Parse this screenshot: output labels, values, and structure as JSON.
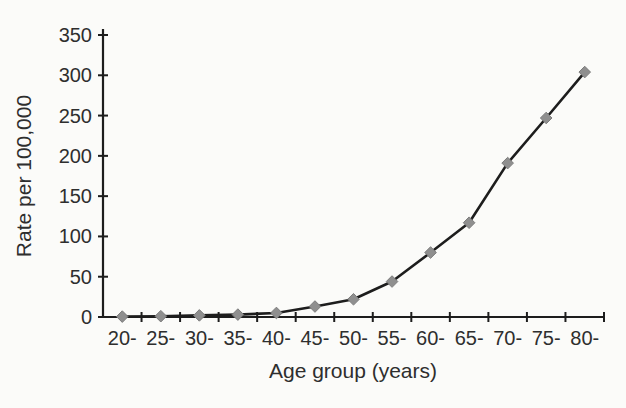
{
  "chart_data": {
    "type": "line",
    "title": "",
    "xlabel": "Age group (years)",
    "ylabel": "Rate per 100,000",
    "categories": [
      "20-",
      "25-",
      "30-",
      "35-",
      "40-",
      "45-",
      "50-",
      "55-",
      "60-",
      "65-",
      "70-",
      "75-",
      "80-"
    ],
    "series": [
      {
        "name": "Rate per 100,000",
        "values": [
          0.5,
          1,
          2,
          3,
          5,
          13,
          22,
          44,
          80,
          117,
          191,
          247,
          304
        ]
      }
    ],
    "ylim": [
      0,
      350
    ],
    "yticks": [
      0,
      50,
      100,
      150,
      200,
      250,
      300,
      350
    ],
    "grid": false,
    "legend_position": "none",
    "marker_shape": "diamond",
    "colors": {
      "line": "#1d1d1d",
      "marker_fill": "#8f8f8f",
      "marker_edge": "#7c7c7c",
      "axis": "#1d1d1d",
      "text": "#2e2e2e",
      "background": "#fbfbf9"
    }
  }
}
